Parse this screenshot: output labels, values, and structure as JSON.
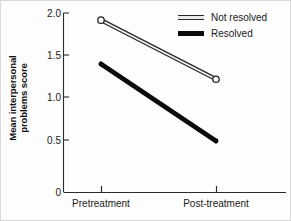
{
  "chart_data": {
    "type": "line",
    "title": "",
    "xlabel": "",
    "ylabel_line1": "Mean interpersonal",
    "ylabel_line2": "problems score",
    "ylabel": "Mean interpersonal problems score",
    "categories": [
      "Pretreatment",
      "Post-treatment"
    ],
    "ylim": [
      0,
      2.0
    ],
    "yticks": [
      "0",
      "0.5",
      "1.0",
      "1.5",
      "2.0"
    ],
    "ytick_values": [
      0,
      0.5,
      1.0,
      1.5,
      2.0
    ],
    "grid": false,
    "legend_position": "top-right",
    "series": [
      {
        "name": "Not resolved",
        "values": [
          1.92,
          1.26
        ],
        "style": "thin-outline-line-with-open-circle-markers",
        "color": "#2a2a2a"
      },
      {
        "name": "Resolved",
        "values": [
          1.43,
          0.57
        ],
        "style": "thick-solid-line",
        "color": "#0b0b0b"
      }
    ]
  },
  "legend": {
    "items": [
      {
        "label": "Not resolved",
        "swatch": "open-double-line-swatch"
      },
      {
        "label": "Resolved",
        "swatch": "solid-thick-line-swatch"
      }
    ]
  },
  "axis": {
    "y_tick_labels": [
      "2.0",
      "1.5",
      "1.0",
      "0.5",
      "0"
    ],
    "x_tick_labels": [
      "Pretreatment",
      "Post-treatment"
    ]
  }
}
